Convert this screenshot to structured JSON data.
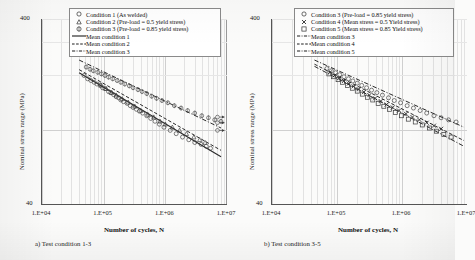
{
  "figure": {
    "panels": [
      {
        "id": "a",
        "caption": "a) Test condition  1-3",
        "axes": {
          "ylabel": "Nominal stress range (MPa)",
          "ytop": "400",
          "ybot": "40",
          "ylim": [
            40,
            400
          ],
          "xlabel": "Number of cycles, N",
          "xlim": [
            10000,
            10000000
          ],
          "xticks": [
            "1.E+04",
            "1.E+05",
            "1.E+06",
            "1.E+07"
          ],
          "xtickvalues": [
            10000,
            100000,
            1000000,
            10000000
          ],
          "scale": "log-log",
          "grid": true
        },
        "legend": [
          {
            "marker": "circle-icon",
            "label": "Condition 1 (As welded)"
          },
          {
            "marker": "triangle-icon",
            "label": "Condition 2 (Pre-load = 0.5 yield stress)"
          },
          {
            "marker": "diamond-icon",
            "label": "Condition 3 (Pre-load = 0.85 yield stress)"
          },
          {
            "marker": "solid-line-icon",
            "label": "Mean condition 1"
          },
          {
            "marker": "dashed-line-icon",
            "label": "Mean condition 2"
          },
          {
            "marker": "dashdot-line-icon",
            "label": "Mean condition 3"
          }
        ]
      },
      {
        "id": "b",
        "caption": "b) Test condition  3-5",
        "axes": {
          "ylabel": "Nominal stress range (MPa)",
          "ytop": "400",
          "ybot": "40",
          "ylim": [
            40,
            400
          ],
          "xlabel": "Number of cycles, N",
          "xlim": [
            10000,
            10000000
          ],
          "xticks": [
            "1.E+04",
            "1.E+05",
            "1.E+06",
            "1.E+07"
          ],
          "xtickvalues": [
            10000,
            100000,
            1000000,
            10000000
          ],
          "scale": "log-log",
          "grid": true
        },
        "legend": [
          {
            "marker": "circle-icon",
            "label": "Condition 3 (Pre-load = 0.85 yield stress)"
          },
          {
            "marker": "cross-icon",
            "label": "Condition 4 (Mean stress = 0.5 Yield stress)"
          },
          {
            "marker": "square-icon",
            "label": "Condition 5 (Mean stress = 0.85 Yield stress)"
          },
          {
            "marker": "dashdot-line-icon",
            "label": "Mean condition 3"
          },
          {
            "marker": "dashed-line-icon",
            "label": "Mean condition 4"
          },
          {
            "marker": "dashdot-line-icon",
            "label": "Mean condition 5"
          }
        ]
      }
    ]
  },
  "chart_data": [
    {
      "type": "scatter",
      "panel": "a",
      "title": "a) Test condition  1-3",
      "xlabel": "Number of cycles, N",
      "ylabel": "Nominal stress range (MPa)",
      "xscale": "log",
      "yscale": "log",
      "xlim": [
        10000,
        10000000
      ],
      "ylim": [
        40,
        400
      ],
      "grid": true,
      "legend_position": "top-center",
      "series": [
        {
          "name": "Condition 1 (As welded)",
          "marker": "circle",
          "points": [
            [
              48000,
              198
            ],
            [
              55000,
              190
            ],
            [
              62000,
              186
            ],
            [
              70000,
              182
            ],
            [
              78000,
              178
            ],
            [
              88000,
              176
            ],
            [
              96000,
              170
            ],
            [
              105000,
              168
            ],
            [
              120000,
              162
            ],
            [
              130000,
              160
            ],
            [
              145000,
              156
            ],
            [
              160000,
              152
            ],
            [
              175000,
              150
            ],
            [
              190000,
              146
            ],
            [
              210000,
              143
            ],
            [
              240000,
              140
            ],
            [
              270000,
              136
            ],
            [
              300000,
              133
            ],
            [
              340000,
              130
            ],
            [
              380000,
              127
            ],
            [
              430000,
              124
            ],
            [
              500000,
              120
            ],
            [
              580000,
              116
            ],
            [
              680000,
              112
            ],
            [
              800000,
              108
            ],
            [
              950000,
              104
            ],
            [
              1200000,
              100
            ],
            [
              1500000,
              96
            ],
            [
              1900000,
              92
            ],
            [
              2400000,
              89
            ],
            [
              3000000,
              86
            ],
            [
              3800000,
              84
            ],
            [
              4600000,
              82
            ],
            [
              5400000,
              80
            ]
          ]
        },
        {
          "name": "Condition 2 (Pre-load = 0.5 yield stress)",
          "marker": "triangle",
          "points": [
            [
              90000,
              175
            ],
            [
              110000,
              168
            ],
            [
              135000,
              160
            ],
            [
              160000,
              155
            ],
            [
              200000,
              148
            ],
            [
              250000,
              142
            ],
            [
              320000,
              135
            ],
            [
              400000,
              128
            ],
            [
              520000,
              122
            ],
            [
              650000,
              118
            ],
            [
              820000,
              112
            ],
            [
              1000000,
              108
            ],
            [
              1300000,
              104
            ],
            [
              1700000,
              100
            ],
            [
              2200000,
              96
            ],
            [
              2900000,
              92
            ],
            [
              3600000,
              89
            ],
            [
              4400000,
              86
            ]
          ]
        },
        {
          "name": "Condition 3 (Pre-load = 0.85 yield stress)",
          "marker": "diamond",
          "points": [
            [
              52000,
              220
            ],
            [
              60000,
              214
            ],
            [
              68000,
              210
            ],
            [
              80000,
              206
            ],
            [
              92000,
              202
            ],
            [
              105000,
              198
            ],
            [
              120000,
              194
            ],
            [
              140000,
              190
            ],
            [
              165000,
              186
            ],
            [
              190000,
              182
            ],
            [
              220000,
              178
            ],
            [
              260000,
              174
            ],
            [
              300000,
              170
            ],
            [
              360000,
              166
            ],
            [
              420000,
              162
            ],
            [
              500000,
              158
            ],
            [
              600000,
              153
            ],
            [
              720000,
              149
            ],
            [
              880000,
              145
            ],
            [
              1100000,
              141
            ],
            [
              1400000,
              136
            ],
            [
              1800000,
              132
            ],
            [
              2300000,
              128
            ],
            [
              3000000,
              124
            ],
            [
              3900000,
              120
            ],
            [
              5000000,
              117
            ],
            [
              6300000,
              114
            ],
            [
              8000000,
              112
            ]
          ]
        }
      ],
      "trendlines": [
        {
          "name": "Mean condition 1",
          "style": "solid",
          "p1": [
            40000,
            205
          ],
          "p2": [
            8000000,
            72
          ]
        },
        {
          "name": "Mean condition 2",
          "style": "dashed",
          "p1": [
            40000,
            213
          ],
          "p2": [
            8000000,
            78
          ]
        },
        {
          "name": "Mean condition 3",
          "style": "dashdot",
          "p1": [
            40000,
            240
          ],
          "p2": [
            8000000,
            103
          ]
        }
      ],
      "runouts": [
        {
          "x": 7000000,
          "y": 118
        },
        {
          "x": 7000000,
          "y": 110
        },
        {
          "x": 7000000,
          "y": 100
        }
      ]
    },
    {
      "type": "scatter",
      "panel": "b",
      "title": "b) Test condition  3-5",
      "xlabel": "Number of cycles, N",
      "ylabel": "Nominal stress range (MPa)",
      "xscale": "log",
      "yscale": "log",
      "xlim": [
        10000,
        10000000
      ],
      "ylim": [
        40,
        400
      ],
      "grid": true,
      "legend_position": "top-center",
      "series": [
        {
          "name": "Condition 3 (Pre-load = 0.85 yield stress)",
          "marker": "circle",
          "points": [
            [
              70000,
              216
            ],
            [
              82000,
              210
            ],
            [
              95000,
              205
            ],
            [
              110000,
              200
            ],
            [
              128000,
              195
            ],
            [
              150000,
              190
            ],
            [
              175000,
              185
            ],
            [
              205000,
              180
            ],
            [
              240000,
              175
            ],
            [
              285000,
              170
            ],
            [
              340000,
              165
            ],
            [
              410000,
              160
            ],
            [
              500000,
              155
            ],
            [
              620000,
              150
            ],
            [
              760000,
              145
            ],
            [
              950000,
              141
            ],
            [
              1200000,
              136
            ],
            [
              1500000,
              132
            ],
            [
              1900000,
              128
            ],
            [
              2400000,
              124
            ],
            [
              3100000,
              120
            ],
            [
              4000000,
              117
            ],
            [
              5200000,
              114
            ],
            [
              6800000,
              111
            ]
          ]
        },
        {
          "name": "Condition 4 (Mean stress = 0.5 Yield stress)",
          "marker": "cross",
          "points": [
            [
              78000,
              206
            ],
            [
              92000,
              198
            ],
            [
              108000,
              192
            ],
            [
              128000,
              185
            ],
            [
              152000,
              179
            ],
            [
              180000,
              173
            ],
            [
              215000,
              167
            ],
            [
              260000,
              161
            ],
            [
              315000,
              155
            ],
            [
              385000,
              149
            ],
            [
              470000,
              144
            ],
            [
              580000,
              138
            ],
            [
              720000,
              133
            ],
            [
              900000,
              128
            ],
            [
              1150000,
              123
            ],
            [
              1450000,
              118
            ],
            [
              1850000,
              114
            ],
            [
              2400000,
              110
            ],
            [
              3100000,
              106
            ],
            [
              4000000,
              102
            ]
          ]
        },
        {
          "name": "Condition 5 (Mean stress = 0.85 Yield stress)",
          "marker": "square",
          "points": [
            [
              75000,
              202
            ],
            [
              88000,
              195
            ],
            [
              104000,
              188
            ],
            [
              122000,
              182
            ],
            [
              145000,
              175
            ],
            [
              172000,
              169
            ],
            [
              205000,
              163
            ],
            [
              245000,
              157
            ],
            [
              295000,
              151
            ],
            [
              355000,
              146
            ],
            [
              430000,
              140
            ],
            [
              525000,
              135
            ],
            [
              640000,
              130
            ],
            [
              790000,
              125
            ],
            [
              980000,
              120
            ],
            [
              1250000,
              115
            ],
            [
              1600000,
              111
            ],
            [
              2050000,
              107
            ],
            [
              2650000,
              103
            ],
            [
              3400000,
              99
            ],
            [
              4400000,
              95
            ],
            [
              5700000,
              92
            ]
          ]
        }
      ],
      "trendlines": [
        {
          "name": "Mean condition 3",
          "style": "dashdot",
          "p1": [
            45000,
            240
          ],
          "p2": [
            9000000,
            104
          ]
        },
        {
          "name": "Mean condition 4",
          "style": "dashed",
          "p1": [
            45000,
            228
          ],
          "p2": [
            9000000,
            88
          ]
        },
        {
          "name": "Mean condition 5",
          "style": "dashdot",
          "p1": [
            45000,
            222
          ],
          "p2": [
            9000000,
            82
          ]
        }
      ],
      "runouts": []
    }
  ]
}
